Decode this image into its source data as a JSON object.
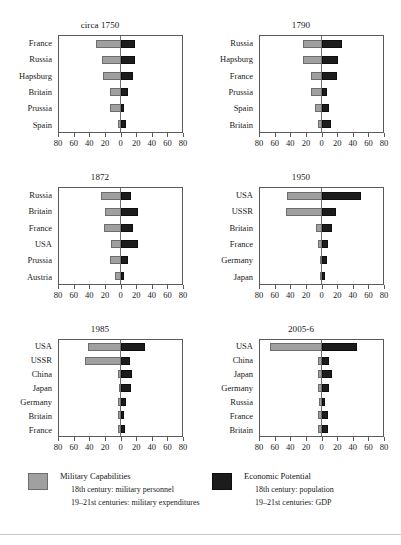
{
  "chart_data": [
    {
      "type": "bar",
      "title": "circa 1750",
      "xlabel": "",
      "ylabel": "",
      "xlim": [
        -80,
        80
      ],
      "grid": false,
      "legend_position": "bottom",
      "xticks": [
        80,
        60,
        40,
        20,
        0,
        20,
        40,
        60,
        80
      ],
      "categories": [
        "France",
        "Russia",
        "Hapsburg",
        "Britain",
        "Prussia",
        "Spain"
      ],
      "series": [
        {
          "name": "Military Capabilities",
          "side": "left",
          "color": "#a0a0a0",
          "values": [
            32,
            24,
            22,
            14,
            13,
            3
          ]
        },
        {
          "name": "Economic Potential",
          "side": "right",
          "color": "#1c1c1c",
          "values": [
            18,
            18,
            16,
            9,
            5,
            7
          ]
        }
      ]
    },
    {
      "type": "bar",
      "title": "1790",
      "xlabel": "",
      "ylabel": "",
      "xlim": [
        -80,
        80
      ],
      "grid": false,
      "legend_position": "bottom",
      "xticks": [
        80,
        60,
        40,
        20,
        0,
        20,
        40,
        60,
        80
      ],
      "categories": [
        "Russia",
        "Hapsburg",
        "France",
        "Prussia",
        "Spain",
        "Britain"
      ],
      "series": [
        {
          "name": "Military Capabilities",
          "side": "left",
          "color": "#a0a0a0",
          "values": [
            24,
            24,
            13,
            14,
            8,
            4
          ]
        },
        {
          "name": "Economic Potential",
          "side": "right",
          "color": "#1c1c1c",
          "values": [
            26,
            21,
            20,
            7,
            10,
            12
          ]
        }
      ]
    },
    {
      "type": "bar",
      "title": "1872",
      "xlabel": "",
      "ylabel": "",
      "xlim": [
        -80,
        80
      ],
      "grid": false,
      "legend_position": "bottom",
      "xticks": [
        80,
        60,
        40,
        20,
        0,
        20,
        40,
        60,
        80
      ],
      "categories": [
        "Russia",
        "Britain",
        "France",
        "USA",
        "Prussia",
        "Austria"
      ],
      "series": [
        {
          "name": "Military Capabilities",
          "side": "left",
          "color": "#a0a0a0",
          "values": [
            25,
            20,
            21,
            12,
            14,
            7
          ]
        },
        {
          "name": "Economic Potential",
          "side": "right",
          "color": "#1c1c1c",
          "values": [
            14,
            23,
            16,
            23,
            10,
            5
          ]
        }
      ]
    },
    {
      "type": "bar",
      "title": "1950",
      "xlabel": "",
      "ylabel": "",
      "xlim": [
        -80,
        80
      ],
      "grid": false,
      "legend_position": "bottom",
      "xticks": [
        80,
        60,
        40,
        20,
        0,
        20,
        40,
        60,
        80
      ],
      "categories": [
        "USA",
        "USSR",
        "Britain",
        "France",
        "Germany",
        "Japan"
      ],
      "series": [
        {
          "name": "Military Capabilities",
          "side": "left",
          "color": "#a0a0a0",
          "values": [
            44,
            46,
            7,
            4,
            1,
            1
          ]
        },
        {
          "name": "Economic Potential",
          "side": "right",
          "color": "#1c1c1c",
          "values": [
            50,
            19,
            13,
            8,
            7,
            5
          ]
        }
      ]
    },
    {
      "type": "bar",
      "title": "1985",
      "xlabel": "",
      "ylabel": "",
      "xlim": [
        -80,
        80
      ],
      "grid": false,
      "legend_position": "bottom",
      "xticks": [
        80,
        60,
        40,
        20,
        0,
        20,
        40,
        60,
        80
      ],
      "categories": [
        "USA",
        "USSR",
        "China",
        "Japan",
        "Germany",
        "Britain",
        "France"
      ],
      "series": [
        {
          "name": "Military Capabilities",
          "side": "left",
          "color": "#a0a0a0",
          "values": [
            41,
            46,
            3,
            2,
            3,
            3,
            3
          ]
        },
        {
          "name": "Economic Potential",
          "side": "right",
          "color": "#1c1c1c",
          "values": [
            31,
            12,
            15,
            13,
            7,
            5,
            6
          ]
        }
      ]
    },
    {
      "type": "bar",
      "title": "2005-6",
      "xlabel": "",
      "ylabel": "",
      "xlim": [
        -80,
        80
      ],
      "grid": false,
      "legend_position": "bottom",
      "xticks": [
        80,
        60,
        40,
        20,
        0,
        20,
        40,
        60,
        80
      ],
      "categories": [
        "USA",
        "China",
        "Japan",
        "Germany",
        "Russia",
        "France",
        "Britain"
      ],
      "series": [
        {
          "name": "Military Capabilities",
          "side": "left",
          "color": "#a0a0a0",
          "values": [
            66,
            5,
            4,
            4,
            3,
            4,
            5
          ]
        },
        {
          "name": "Economic Potential",
          "side": "right",
          "color": "#1c1c1c",
          "values": [
            46,
            9,
            14,
            10,
            4,
            8,
            8
          ]
        }
      ]
    }
  ],
  "legend": {
    "military": {
      "label": "Military Capabilities",
      "line1": "18th century: military personnel",
      "line2": "19–21st centuries: military expenditures",
      "color": "#a0a0a0"
    },
    "economic": {
      "label": "Economic Potential",
      "line1": "18th century: population",
      "line2": "19–21st centuries: GDP",
      "color": "#1c1c1c"
    }
  }
}
